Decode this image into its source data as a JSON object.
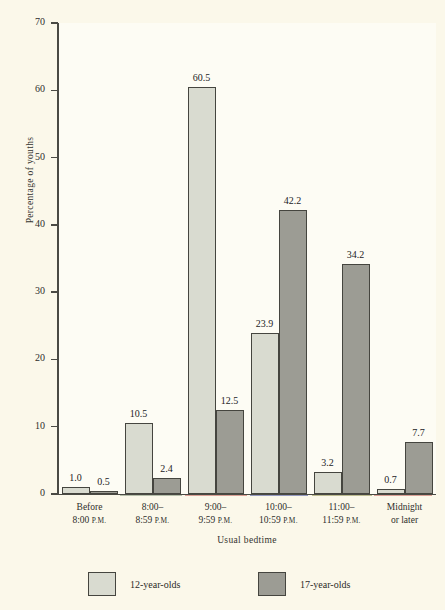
{
  "chart_data": {
    "type": "bar",
    "title": "",
    "xlabel": "Usual bedtime",
    "ylabel": "Percentage of youths",
    "ylim": [
      0,
      70
    ],
    "yticks": [
      0,
      10,
      20,
      30,
      40,
      50,
      60,
      70
    ],
    "grid": false,
    "legend_position": "bottom-left",
    "categories": [
      "Before 8:00 P.M.",
      "8:00–8:59 P.M.",
      "9:00–9:59 P.M.",
      "10:00–10:59 P.M.",
      "11:00–11:59 P.M.",
      "Midnight or later"
    ],
    "category_lines": [
      [
        "Before",
        "8:00 P.M."
      ],
      [
        "8:00–",
        "8:59 P.M."
      ],
      [
        "9:00–",
        "9:59 P.M."
      ],
      [
        "10:00–",
        "10:59 P.M."
      ],
      [
        "11:00–",
        "11:59 P.M."
      ],
      [
        "Midnight",
        "or later"
      ]
    ],
    "series": [
      {
        "name": "12-year-olds",
        "color": "#d9dbd0",
        "values": [
          1.0,
          10.5,
          60.5,
          23.9,
          3.2,
          0.7
        ],
        "labels": [
          "1.0",
          "10.5",
          "60.5",
          "23.9",
          "3.2",
          "0.7"
        ]
      },
      {
        "name": "17-year-olds",
        "color": "#9c9c94",
        "values": [
          0.5,
          2.4,
          12.5,
          42.2,
          34.2,
          7.7
        ],
        "labels": [
          "0.5",
          "2.4",
          "12.5",
          "42.2",
          "34.2",
          "7.7"
        ]
      }
    ]
  },
  "axes": {
    "y_title": "Percentage of youths",
    "x_title": "Usual bedtime",
    "y_tick_labels": [
      "0",
      "10",
      "20",
      "30",
      "40",
      "50",
      "60",
      "70"
    ]
  },
  "legend": {
    "items": [
      {
        "label": "12-year-olds",
        "series": "a"
      },
      {
        "label": "17-year-olds",
        "series": "b"
      }
    ]
  },
  "colors": {
    "background": "#fbf8ea",
    "plot_background": "#fdfcf4",
    "series_a": "#d9dbd0",
    "series_b": "#9c9c94",
    "axis": "#4a4a44",
    "text": "#2b2b28"
  }
}
